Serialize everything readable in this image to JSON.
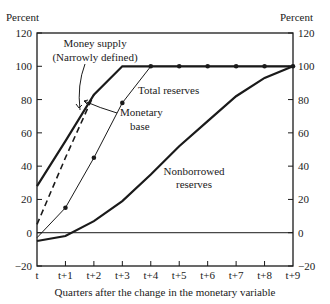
{
  "chart_data": {
    "type": "line",
    "title": "",
    "xlabel": "Quarters after the change in the monetary variable",
    "ylabel_left": "Percent",
    "ylabel_right": "Percent",
    "categories": [
      "t",
      "t+1",
      "t+2",
      "t+3",
      "t+4",
      "t+5",
      "t+6",
      "t+7",
      "t+8",
      "t+9"
    ],
    "yticks": [
      120,
      100,
      80,
      60,
      40,
      20,
      0,
      -20
    ],
    "ylim": [
      -20,
      120
    ],
    "grid": false,
    "series": [
      {
        "name": "Money supply (Narrowly defined)",
        "style": "thick-solid",
        "values": [
          28,
          55,
          83,
          100,
          100,
          100,
          100,
          100,
          100,
          100
        ]
      },
      {
        "name": "Monetary base",
        "style": "dashed",
        "values": [
          5,
          45,
          83,
          100,
          100,
          100,
          100,
          100,
          100,
          100
        ]
      },
      {
        "name": "Total reserves",
        "style": "thin-solid-markers",
        "values": [
          -3,
          15,
          45,
          78,
          100,
          100,
          100,
          100,
          100,
          100
        ]
      },
      {
        "name": "Nonborrowed reserves",
        "style": "thick-solid",
        "values": [
          -5,
          -2,
          7,
          19,
          35,
          52,
          67,
          82,
          93,
          100
        ]
      }
    ],
    "annotations": [
      {
        "text_lines": [
          "Money supply",
          "(Narrowly defined)"
        ],
        "target": "Money supply (Narrowly defined)"
      },
      {
        "text_lines": [
          "Monetary",
          "base"
        ],
        "target": "Monetary base"
      },
      {
        "text_lines": [
          "Total reserves"
        ],
        "target": "Total reserves"
      },
      {
        "text_lines": [
          "Nonborrowed",
          "reserves"
        ],
        "target": "Nonborrowed reserves"
      }
    ]
  },
  "labels": {
    "percent_left": "Percent",
    "percent_right": "Percent",
    "xlabel": "Quarters after the change in the monetary variable",
    "money_supply_1": "Money supply",
    "money_supply_2": "(Narrowly defined)",
    "monetary_base_1": "Monetary",
    "monetary_base_2": "base",
    "total_reserves": "Total reserves",
    "nonborrowed_1": "Nonborrowed",
    "nonborrowed_2": "reserves"
  },
  "ticks": {
    "y": [
      "120",
      "100",
      "80",
      "60",
      "40",
      "20",
      "0",
      "-20"
    ],
    "x": [
      "t",
      "t+1",
      "t+2",
      "t+3",
      "t+4",
      "t+5",
      "t+6",
      "t+7",
      "t+8",
      "t+9"
    ]
  }
}
